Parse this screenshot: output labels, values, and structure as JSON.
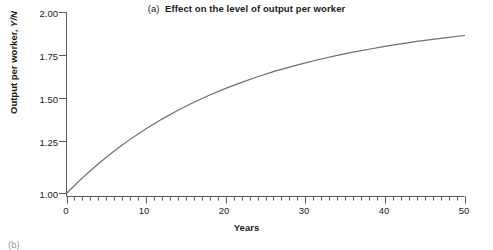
{
  "figure": {
    "panel_tag": "(a)",
    "title": "Effect on the level of output per worker",
    "title_full": "(a)  Effect on the level of output per worker",
    "next_panel_tag": "(b)"
  },
  "axes": {
    "ylabel_text": "Output per worker, ",
    "ylabel_symbol": "Y/N",
    "xlabel": "Years",
    "y_ticks": [
      "1.00",
      "1.25",
      "1.50",
      "1.75",
      "2.00"
    ],
    "x_ticks": [
      "0",
      "10",
      "20",
      "30",
      "40",
      "50"
    ]
  },
  "style": {
    "curve_color": "#6f6f6f",
    "axis_color": "#5a5a5a",
    "text_color": "#1a1a1a",
    "background": "#ffffff"
  },
  "chart_data": {
    "type": "line",
    "title": "(a)  Effect on the level of output per worker",
    "xlabel": "Years",
    "ylabel": "Output per worker, Y/N",
    "xlim": [
      0,
      50
    ],
    "ylim": [
      1.0,
      2.0
    ],
    "grid": false,
    "legend": "none",
    "x_tick_values": [
      0,
      10,
      20,
      30,
      40,
      50
    ],
    "y_tick_values": [
      1.0,
      1.25,
      1.5,
      1.75,
      2.0
    ],
    "x_minor_tick_interval": 1,
    "series": [
      {
        "name": "Output per worker, Y/N",
        "color": "#6f6f6f",
        "x": [
          0,
          1,
          2,
          3,
          4,
          5,
          6,
          7,
          8,
          9,
          10,
          12,
          14,
          16,
          18,
          20,
          22,
          24,
          26,
          28,
          30,
          32,
          34,
          36,
          38,
          40,
          42,
          44,
          46,
          48,
          50
        ],
        "y": [
          1.0,
          1.044,
          1.086,
          1.126,
          1.164,
          1.2,
          1.235,
          1.268,
          1.299,
          1.329,
          1.358,
          1.411,
          1.46,
          1.504,
          1.544,
          1.581,
          1.614,
          1.645,
          1.673,
          1.698,
          1.722,
          1.743,
          1.763,
          1.781,
          1.797,
          1.813,
          1.827,
          1.84,
          1.852,
          1.863,
          1.873
        ]
      }
    ],
    "annotations": [
      {
        "text": "Output rises smoothly from 1.00 at year 0 toward about 1.93, with a decreasing growth rate."
      }
    ],
    "start_value": 1.0,
    "end_value": 1.93
  }
}
